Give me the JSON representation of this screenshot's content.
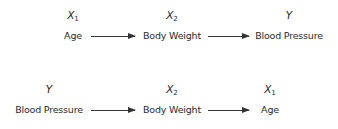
{
  "rows": [
    {
      "nodes": [
        {
          "var": "X",
          "sub": "1",
          "label": "Age"
        },
        {
          "var": "X",
          "sub": "2",
          "label": "Body Weight"
        },
        {
          "var": "Y",
          "sub": "",
          "label": "Blood Pressure"
        }
      ],
      "arrows": [
        "Age → Body Weight",
        "Body Weight → Blood Pressure"
      ]
    },
    {
      "nodes": [
        {
          "var": "Y",
          "sub": "",
          "label": "Blood Pressure"
        },
        {
          "var": "X",
          "sub": "2",
          "label": "Body Weight"
        },
        {
          "var": "X",
          "sub": "1",
          "label": "Age"
        }
      ],
      "arrows": [
        "Blood Pressure → Body Weight",
        "Body Weight → Age"
      ]
    }
  ],
  "colors": {
    "text": "#2a2a2a",
    "arrow": "#333333",
    "background": "#ffffff"
  }
}
